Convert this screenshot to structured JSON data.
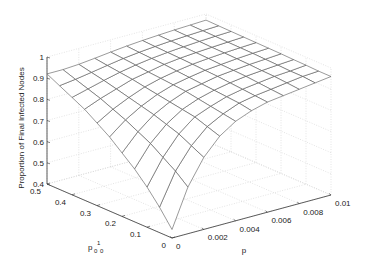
{
  "chart_data": {
    "type": "surface",
    "title": "",
    "xlabel": "p",
    "ylabel": "p_0^1",
    "zlabel": "Proportion of Final Infected Nodes",
    "x_ticks": [
      0,
      0.002,
      0.004,
      0.006,
      0.008,
      0.01
    ],
    "x_tick_labels": [
      "0",
      "0.002",
      "0.004",
      "0.006",
      "0.008",
      "0.01"
    ],
    "y_ticks": [
      0,
      0.1,
      0.2,
      0.3,
      0.4,
      0.5
    ],
    "y_tick_labels": [
      "0",
      "0.1",
      "0.2",
      "0.3",
      "0.4",
      "0.5"
    ],
    "z_ticks": [
      0.4,
      0.5,
      0.6,
      0.7,
      0.8,
      0.9,
      1
    ],
    "z_tick_labels": [
      "0.4",
      "0.5",
      "0.6",
      "0.7",
      "0.8",
      "0.9",
      "1"
    ],
    "xlim": [
      0,
      0.01
    ],
    "ylim": [
      0,
      0.5
    ],
    "zlim": [
      0.4,
      1
    ],
    "grid": true,
    "mesh_color": "#555555",
    "x": [
      0,
      0.001,
      0.002,
      0.003,
      0.004,
      0.005,
      0.006,
      0.007,
      0.008,
      0.009,
      0.01
    ],
    "y": [
      0,
      0.05,
      0.1,
      0.15,
      0.2,
      0.25,
      0.3,
      0.35,
      0.4,
      0.45,
      0.5
    ],
    "z": [
      [
        0.44,
        0.62,
        0.74,
        0.82,
        0.87,
        0.9,
        0.92,
        0.93,
        0.94,
        0.95,
        0.96
      ],
      [
        0.52,
        0.67,
        0.77,
        0.84,
        0.88,
        0.91,
        0.925,
        0.935,
        0.945,
        0.955,
        0.96
      ],
      [
        0.59,
        0.71,
        0.8,
        0.86,
        0.89,
        0.915,
        0.93,
        0.94,
        0.95,
        0.955,
        0.962
      ],
      [
        0.65,
        0.75,
        0.82,
        0.87,
        0.9,
        0.92,
        0.935,
        0.945,
        0.952,
        0.958,
        0.963
      ],
      [
        0.7,
        0.78,
        0.84,
        0.88,
        0.91,
        0.925,
        0.94,
        0.948,
        0.955,
        0.96,
        0.965
      ],
      [
        0.75,
        0.81,
        0.855,
        0.89,
        0.915,
        0.93,
        0.943,
        0.95,
        0.957,
        0.962,
        0.966
      ],
      [
        0.79,
        0.835,
        0.87,
        0.9,
        0.92,
        0.935,
        0.946,
        0.953,
        0.959,
        0.963,
        0.967
      ],
      [
        0.83,
        0.86,
        0.885,
        0.91,
        0.925,
        0.94,
        0.949,
        0.955,
        0.96,
        0.964,
        0.968
      ],
      [
        0.86,
        0.88,
        0.9,
        0.918,
        0.932,
        0.943,
        0.951,
        0.957,
        0.962,
        0.966,
        0.969
      ],
      [
        0.89,
        0.9,
        0.912,
        0.925,
        0.937,
        0.946,
        0.953,
        0.959,
        0.963,
        0.967,
        0.97
      ],
      [
        0.92,
        0.92,
        0.925,
        0.933,
        0.942,
        0.95,
        0.956,
        0.961,
        0.965,
        0.968,
        0.971
      ]
    ]
  }
}
